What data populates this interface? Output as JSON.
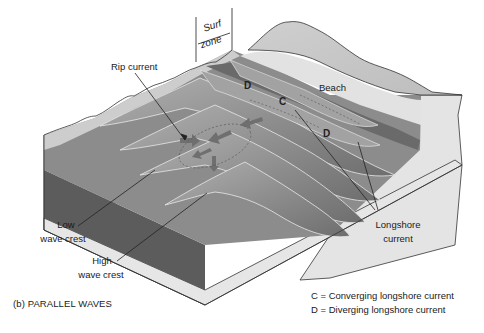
{
  "figure": {
    "caption": "(b) PARALLEL WAVES",
    "labels": {
      "surf": "Surf",
      "zone": "zone",
      "rip_current": "Rip current",
      "beach": "Beach",
      "low_wave_crest_1": "Low",
      "low_wave_crest_2": "wave crest",
      "high_wave_crest_1": "High",
      "high_wave_crest_2": "wave crest",
      "longshore_1": "Longshore",
      "longshore_2": "current",
      "c_marker": "C",
      "d_marker_left": "D",
      "d_marker_right": "D"
    },
    "legend": [
      {
        "key": "C",
        "text": "C = Converging longshore current"
      },
      {
        "key": "D",
        "text": "D = Diverging longshore current"
      }
    ],
    "colors": {
      "deep_water": "#5e5e5e",
      "mid_water": "#8a8a8a",
      "crest": "#a8a8a8",
      "shallow_water": "#bdbdbd",
      "beach": "#dedede",
      "land": "#c9c9c9",
      "block_side": "#e2e2e2",
      "water_side_light": "#d6d6d6",
      "outline": "#333333",
      "arrow": "#707070"
    }
  }
}
